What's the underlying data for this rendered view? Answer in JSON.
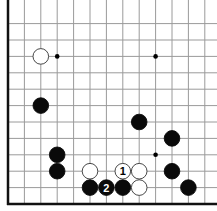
{
  "diagram": {
    "type": "go-board-corner",
    "corner": "bottom-left",
    "grid": {
      "origin_x": 8,
      "origin_y": 204,
      "spacing": 16.4,
      "cols": 13,
      "rows": 12
    },
    "colors": {
      "line": "#9a9a9a",
      "edge": "#111111",
      "black": "#0a0a0a",
      "white": "#ffffff"
    },
    "hoshi": [
      {
        "col": 3,
        "row": 9
      },
      {
        "col": 9,
        "row": 9
      },
      {
        "col": 9,
        "row": 3
      }
    ],
    "stones": [
      {
        "color": "white",
        "col": 2,
        "row": 9,
        "label": ""
      },
      {
        "color": "black",
        "col": 2,
        "row": 6,
        "label": ""
      },
      {
        "color": "black",
        "col": 3,
        "row": 3,
        "label": ""
      },
      {
        "color": "black",
        "col": 3,
        "row": 2,
        "label": ""
      },
      {
        "color": "white",
        "col": 5,
        "row": 2,
        "label": ""
      },
      {
        "color": "black",
        "col": 5,
        "row": 1,
        "label": ""
      },
      {
        "color": "black",
        "col": 6,
        "row": 1,
        "label": "2"
      },
      {
        "color": "black",
        "col": 7,
        "row": 1,
        "label": ""
      },
      {
        "color": "white",
        "col": 7,
        "row": 2,
        "label": "1"
      },
      {
        "color": "white",
        "col": 8,
        "row": 2,
        "label": ""
      },
      {
        "color": "white",
        "col": 8,
        "row": 1,
        "label": ""
      },
      {
        "color": "black",
        "col": 8,
        "row": 5,
        "label": ""
      },
      {
        "color": "black",
        "col": 10,
        "row": 4,
        "label": ""
      },
      {
        "color": "black",
        "col": 10,
        "row": 2,
        "label": ""
      },
      {
        "color": "black",
        "col": 11,
        "row": 1,
        "label": ""
      }
    ]
  }
}
